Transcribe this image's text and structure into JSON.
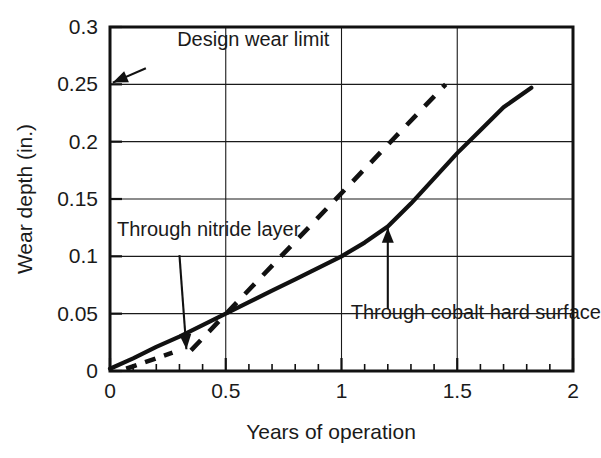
{
  "chart_data": {
    "type": "line",
    "title": "",
    "xlabel": "Years of operation",
    "ylabel": "Wear depth (in.)",
    "xlim": [
      0,
      2
    ],
    "ylim": [
      0,
      0.3
    ],
    "grid": true,
    "legend_position": "none",
    "x_ticks": [
      0,
      0.5,
      1,
      1.5,
      2
    ],
    "x_tick_labels": [
      "0",
      "0.5",
      "1",
      "1.5",
      "2"
    ],
    "x_minor_tick_step": 0.1,
    "y_ticks": [
      0,
      0.05,
      0.1,
      0.15,
      0.2,
      0.25,
      0.3
    ],
    "y_tick_labels": [
      "0",
      "0.05",
      "0.1",
      "0.15",
      "0.2",
      "0.25",
      "0.3"
    ],
    "series": [
      {
        "name": "Through cobalt hard surface",
        "style": "solid",
        "x": [
          0.0,
          0.1,
          0.2,
          0.3,
          0.4,
          0.5,
          0.6,
          0.7,
          0.8,
          0.9,
          1.0,
          1.1,
          1.2,
          1.3,
          1.4,
          1.5,
          1.6,
          1.7,
          1.82
        ],
        "y": [
          0.002,
          0.011,
          0.021,
          0.03,
          0.04,
          0.05,
          0.06,
          0.07,
          0.08,
          0.09,
          0.1,
          0.112,
          0.126,
          0.146,
          0.168,
          0.19,
          0.21,
          0.23,
          0.247
        ]
      },
      {
        "name": "Through nitride layer",
        "style": "dashed",
        "x": [
          0.35,
          1.45
        ],
        "y": [
          0.018,
          0.25
        ]
      },
      {
        "name": "nitride-initial-segment",
        "style": "dashed-short",
        "x": [
          0.07,
          0.27
        ],
        "y": [
          0.002,
          0.016
        ]
      }
    ],
    "annotations": [
      {
        "id": "design-wear-limit",
        "text": "Design wear limit",
        "text_x": 0.29,
        "text_y": 0.283,
        "arrow_from_x": 0.155,
        "arrow_from_y": 0.264,
        "arrow_to_x": 0.012,
        "arrow_to_y": 0.2515
      },
      {
        "id": "through-nitride-layer",
        "text": "Through nitride layer",
        "text_x": 0.03,
        "text_y": 0.118,
        "arrow_from_x": 0.3,
        "arrow_from_y": 0.101,
        "arrow_to_x": 0.33,
        "arrow_to_y": 0.019
      },
      {
        "id": "through-cobalt-hard-surface",
        "text": "Through cobalt hard surface",
        "text_x": 1.04,
        "text_y": 0.045,
        "arrow_from_x": 1.2,
        "arrow_from_y": 0.054,
        "arrow_to_x": 1.2,
        "arrow_to_y": 0.125
      }
    ],
    "reference_lines": [
      {
        "id": "design-wear-limit-level",
        "value": 0.25,
        "orientation": "horizontal"
      }
    ]
  }
}
